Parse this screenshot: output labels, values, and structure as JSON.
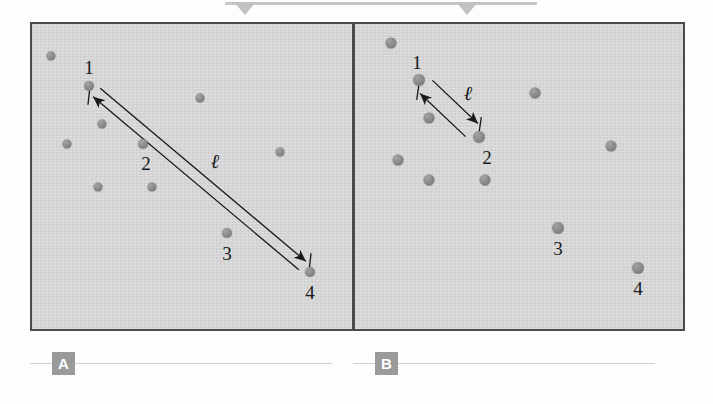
{
  "figure": {
    "type": "scientific-diagram",
    "background_color": "#fdfdfc",
    "panel_fill": "#d5d5d5",
    "panel_border_color": "#4a4a4a",
    "particle_color": "#8c8c8c",
    "annotation_color": "#16181a",
    "badge_color": "#9a9a9a"
  },
  "top_decoration": {
    "bar_color": "#c6c6c6",
    "notch_color": "#c2c2c2",
    "notch_count": 2
  },
  "panels": [
    {
      "id": "A",
      "badge_label": "A",
      "length_symbol": "ℓ",
      "numbered_particles": [
        {
          "label": "1",
          "x": 89,
          "y": 86
        },
        {
          "label": "2",
          "x": 143,
          "y": 144
        },
        {
          "label": "3",
          "x": 227,
          "y": 233
        },
        {
          "label": "4",
          "x": 310,
          "y": 272
        }
      ],
      "number_label_positions": [
        {
          "label": "1",
          "x": 89,
          "y": 67
        },
        {
          "label": "2",
          "x": 146,
          "y": 163
        },
        {
          "label": "3",
          "x": 227,
          "y": 253
        },
        {
          "label": "4",
          "x": 310,
          "y": 292
        }
      ],
      "length_label_position": {
        "x": 215,
        "y": 161
      },
      "other_particles": [
        {
          "x": 51,
          "y": 56
        },
        {
          "x": 102,
          "y": 124
        },
        {
          "x": 67,
          "y": 144
        },
        {
          "x": 98,
          "y": 187
        },
        {
          "x": 152,
          "y": 187
        },
        {
          "x": 200,
          "y": 98
        },
        {
          "x": 280,
          "y": 152
        }
      ],
      "measure_arrow": {
        "from": {
          "x": 89,
          "y": 86
        },
        "to": {
          "x": 310,
          "y": 272
        },
        "double_headed": true,
        "tick_marks": 2
      }
    },
    {
      "id": "B",
      "badge_label": "B",
      "length_symbol": "ℓ",
      "numbered_particles": [
        {
          "label": "1",
          "x": 419,
          "y": 80
        },
        {
          "label": "2",
          "x": 479,
          "y": 137
        },
        {
          "label": "3",
          "x": 558,
          "y": 228
        },
        {
          "label": "4",
          "x": 638,
          "y": 268
        }
      ],
      "number_label_positions": [
        {
          "label": "1",
          "x": 417,
          "y": 62
        },
        {
          "label": "2",
          "x": 487,
          "y": 157
        },
        {
          "label": "3",
          "x": 558,
          "y": 248
        },
        {
          "label": "4",
          "x": 638,
          "y": 288
        }
      ],
      "length_label_position": {
        "x": 468,
        "y": 93
      },
      "other_particles": [
        {
          "x": 391,
          "y": 43
        },
        {
          "x": 429,
          "y": 118
        },
        {
          "x": 398,
          "y": 160
        },
        {
          "x": 429,
          "y": 180
        },
        {
          "x": 485,
          "y": 180
        },
        {
          "x": 535,
          "y": 93
        },
        {
          "x": 611,
          "y": 146
        }
      ],
      "measure_arrow": {
        "from": {
          "x": 419,
          "y": 80
        },
        "to": {
          "x": 479,
          "y": 137
        },
        "double_headed": true,
        "tick_marks": 2
      }
    }
  ]
}
